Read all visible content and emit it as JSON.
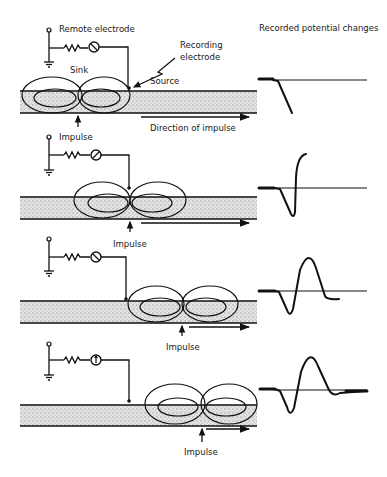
{
  "title": "Recorded potential changes",
  "colors": {
    "ink": "#111111",
    "axon_fill": "#d6d6d6",
    "background": "#ffffff"
  },
  "labels": {
    "remote_electrode": "Remote electrode",
    "recording_electrode_line1": "Recording",
    "recording_electrode_line2": "electrode",
    "sink": "Sink",
    "source": "Source",
    "direction": "Direction of impulse",
    "impulse": "Impulse"
  },
  "panels": [
    {
      "id": 1,
      "impulse_x": 79,
      "recording_x": 133,
      "meter_needle": "down-right",
      "waveform": "initial-negative-deflection"
    },
    {
      "id": 2,
      "impulse_x": 130,
      "recording_x": 130,
      "meter_needle": "up-right",
      "waveform": "negative-then-sharp-positive"
    },
    {
      "id": 3,
      "impulse_x": 182,
      "recording_x": 125,
      "meter_needle": "down-right",
      "waveform": "biphasic-positive-peak"
    },
    {
      "id": 4,
      "impulse_x": 202,
      "recording_x": 130,
      "meter_needle": "up",
      "waveform": "triphasic-return-to-baseline"
    }
  ],
  "icons": {
    "ground": "ground-symbol",
    "resistor": "resistor-zigzag",
    "meter": "galvanometer-circle",
    "electrode_terminal": "open-circle-terminal"
  }
}
